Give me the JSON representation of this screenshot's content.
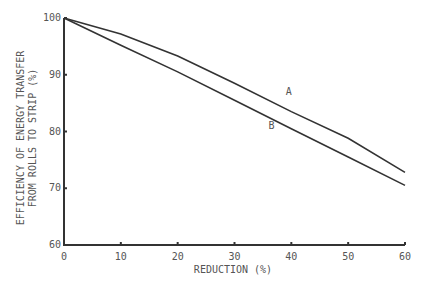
{
  "chart_data": {
    "type": "line",
    "title": "",
    "xlabel": "REDUCTION (%)",
    "ylabel_line1": "EFFICIENCY OF ENERGY TRANSFER",
    "ylabel_line2": "FROM ROLLS TO STRIP (%)",
    "xlim": [
      0,
      60
    ],
    "ylim": [
      60,
      100
    ],
    "x_ticks": [
      "0",
      "10",
      "20",
      "30",
      "40",
      "50",
      "60"
    ],
    "y_ticks": [
      "60",
      "70",
      "80",
      "90",
      "100"
    ],
    "grid": false,
    "legend": "inline labels",
    "x": [
      0,
      10,
      20,
      30,
      40,
      50,
      60
    ],
    "series": [
      {
        "name": "A",
        "values": [
          100,
          97.2,
          93.3,
          88.5,
          83.5,
          78.8,
          72.8
        ]
      },
      {
        "name": "B",
        "values": [
          100,
          95.2,
          90.5,
          85.5,
          80.5,
          75.5,
          70.5
        ]
      }
    ]
  }
}
